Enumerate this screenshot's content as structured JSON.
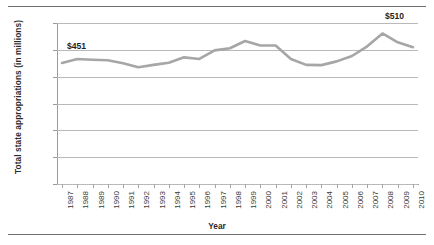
{
  "chart_data": {
    "type": "line",
    "title": "",
    "xlabel": "Year",
    "ylabel": "Total state appropriations (in millions)",
    "grid": "horizontal",
    "legend": "none",
    "xlim": [
      1987,
      2010
    ],
    "ylim": [
      0,
      600
    ],
    "ytick_labels": [
      "$600",
      "$500",
      "$400",
      "$300",
      "$200",
      "$100",
      "$-"
    ],
    "ytick_values": [
      600,
      500,
      400,
      300,
      200,
      100,
      0
    ],
    "categories": [
      "1987",
      "1988",
      "1989",
      "1990",
      "1991",
      "1992",
      "1993",
      "1994",
      "1995",
      "1996",
      "1997",
      "1998",
      "1999",
      "2000",
      "2001",
      "2002",
      "2003",
      "2004",
      "2005",
      "2006",
      "2007",
      "2008",
      "2009",
      "2010"
    ],
    "values": [
      451,
      466,
      463,
      461,
      450,
      435,
      444,
      452,
      472,
      466,
      498,
      506,
      533,
      516,
      516,
      466,
      444,
      443,
      457,
      477,
      513,
      561,
      528,
      510
    ],
    "series": [
      {
        "name": "Total state appropriations",
        "color": "#a6a6a6",
        "values": [
          451,
          466,
          463,
          461,
          450,
          435,
          444,
          452,
          472,
          466,
          498,
          506,
          533,
          516,
          516,
          466,
          444,
          443,
          457,
          477,
          513,
          561,
          528,
          510
        ]
      }
    ],
    "annotations": [
      {
        "label": "$451",
        "year": "1987",
        "value": 451
      },
      {
        "label": "$510",
        "year": "2010",
        "value": 510
      }
    ]
  }
}
